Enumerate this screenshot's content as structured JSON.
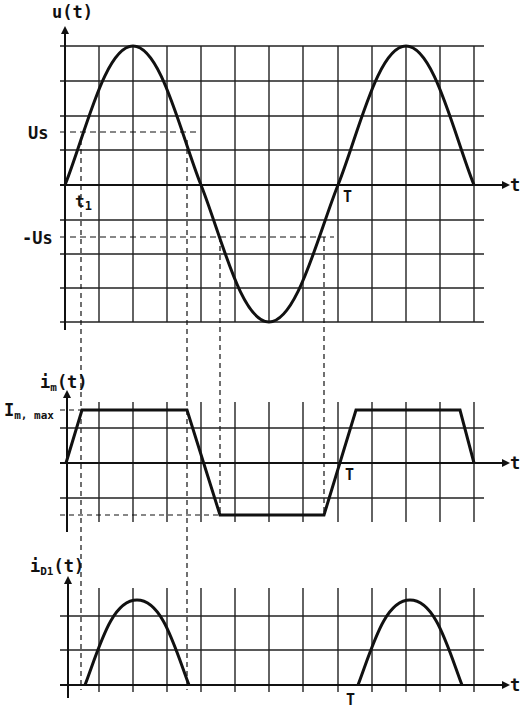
{
  "diagram": {
    "colors": {
      "ink": "#111111",
      "grid": "#222222",
      "background": "#ffffff"
    },
    "plots": [
      {
        "id": "voltage",
        "y_label": "u(t)",
        "x_label": "t",
        "level_labels": {
          "pos": "Us",
          "neg": "-Us"
        },
        "time_labels": {
          "t1": "t1",
          "T": "T"
        },
        "waveform": "sine, 1.5 periods, amplitude 4 grid units, period 8 grid units"
      },
      {
        "id": "magnetizing-current",
        "y_label_main": "i",
        "y_label_sub": "m",
        "y_label_tail": "(t)",
        "level_label_main": "I",
        "level_label_sub": "m, max",
        "x_label": "t",
        "time_labels": {
          "T": "T"
        },
        "waveform": "trapezoid: ramps between -Imax and +Imax when |u| < Us, flat otherwise"
      },
      {
        "id": "diode-current",
        "y_label_main": "i",
        "y_label_sub": "D1",
        "y_label_tail": "(t)",
        "x_label": "t",
        "time_labels": {
          "T": "T"
        },
        "waveform": "half-sine pulses during interval where u > Us"
      }
    ]
  }
}
